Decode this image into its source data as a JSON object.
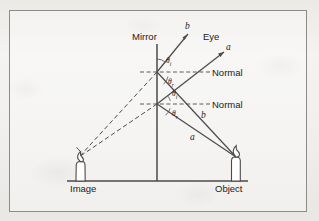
{
  "figure": {
    "title_caption": "",
    "labels": {
      "mirror": "Mirror",
      "eye": "Eye",
      "normal_upper": "Normal",
      "normal_lower": "Normal",
      "image": "Image",
      "object": "Object",
      "ray_b_top": "b",
      "ray_a_top": "a",
      "ray_b_mid": "b",
      "ray_a_low": "a",
      "theta_i_upper": "θ",
      "theta_i_upper_sub": "i",
      "theta_r_upper": "θ",
      "theta_r_upper_sub": "r",
      "theta_i_lower": "θ",
      "theta_i_lower_sub": "i",
      "theta_r_lower": "θ",
      "theta_r_lower_sub": "r"
    },
    "colors": {
      "ink": "#3f3f3f",
      "ink_dark": "#1a1a1a",
      "border": "#8b8b8b",
      "paper": "#f2f1ef"
    },
    "geometry": {
      "mirror_x": 157,
      "mirror_top_y": 44,
      "mirror_bottom_y": 181,
      "baseline_y": 181,
      "baseline_x_start": 67,
      "baseline_x_end": 248,
      "reflection_point_upper": [
        157,
        72
      ],
      "reflection_point_lower": [
        157,
        104
      ],
      "object_flame": [
        236,
        157
      ],
      "image_flame": [
        79,
        157
      ]
    },
    "diagram_type": "ray-diagram-plane-mirror"
  }
}
